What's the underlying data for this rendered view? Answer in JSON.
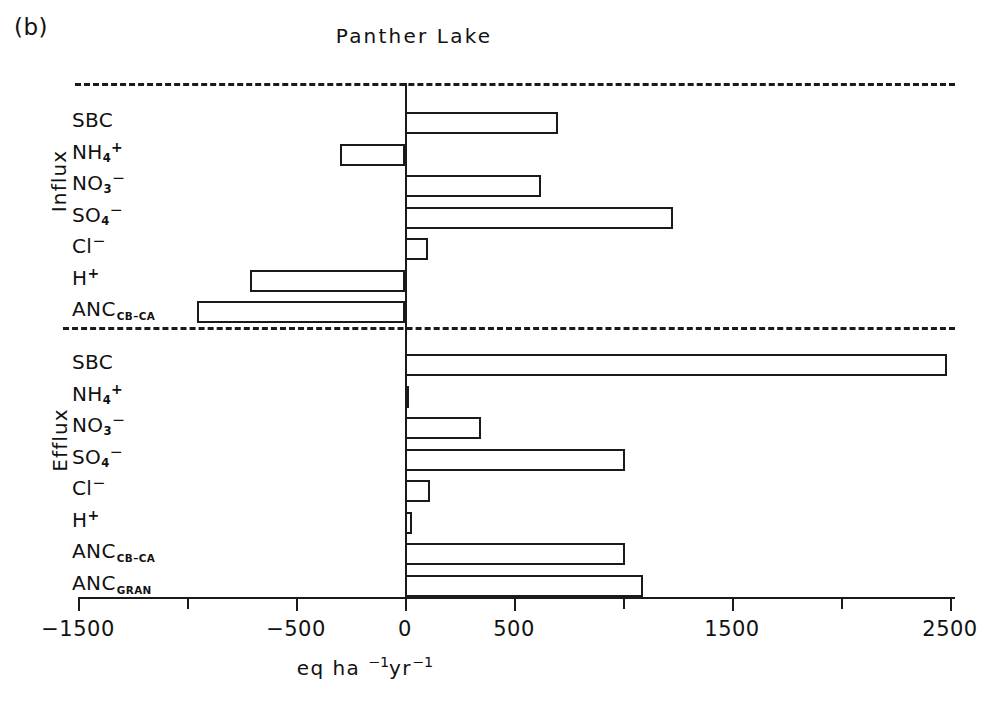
{
  "figure": {
    "panel_letter": "(b)",
    "title": "Panther Lake",
    "xlabel_parts": {
      "main": "eq ha",
      "sup1": "−1",
      "mid": "yr",
      "sup2": "−1"
    }
  },
  "axis": {
    "xlim": [
      -1500,
      2500
    ],
    "major_ticks": [
      -1500,
      -500,
      0,
      500,
      1500,
      2500
    ],
    "minor_ticks": [
      -1000,
      1000,
      2000
    ],
    "tick_labels": [
      "−1500",
      "−500",
      "0",
      "500",
      "1500",
      "2500"
    ],
    "unit_label": "eq ha −1 yr −1"
  },
  "groups": [
    {
      "name": "Influx",
      "caption": "Influx"
    },
    {
      "name": "Efflux",
      "caption": "Efflux"
    }
  ],
  "chart_data": {
    "type": "bar",
    "orientation": "horizontal",
    "title": "Panther Lake",
    "xlabel": "eq ha⁻¹yr⁻¹",
    "ylabel": "",
    "xlim": [
      -1500,
      2500
    ],
    "xticks": [
      -1500,
      -1000,
      -500,
      0,
      500,
      1000,
      1500,
      2000,
      2500
    ],
    "xtick_labels": [
      "−1500",
      "",
      "−500",
      "0",
      "500",
      "",
      "1500",
      "",
      "2500"
    ],
    "grid": false,
    "legend": "none",
    "groups": [
      {
        "name": "Influx",
        "categories": [
          "SBC",
          "NH4+",
          "NO3-",
          "SO4-",
          "Cl-",
          "H+",
          "ANC_CB-CA"
        ],
        "values": [
          700,
          -300,
          625,
          1230,
          105,
          -710,
          -955
        ]
      },
      {
        "name": "Efflux",
        "categories": [
          "SBC",
          "NH4+",
          "NO3-",
          "SO4-",
          "Cl-",
          "H+",
          "ANC_CB-CA",
          "ANC_GRAN"
        ],
        "values": [
          2485,
          10,
          350,
          1010,
          115,
          30,
          1010,
          1090
        ]
      }
    ]
  },
  "influx_rows": [
    {
      "label": "SBC",
      "sub": "",
      "sup": "",
      "value": 700
    },
    {
      "label": "NH",
      "sub": "4",
      "sup": "+",
      "value": -300
    },
    {
      "label": "NO",
      "sub": "3",
      "sup": "−",
      "value": 625
    },
    {
      "label": "SO",
      "sub": "4",
      "sup": "−",
      "value": 1230
    },
    {
      "label": "Cl",
      "sub": "",
      "sup": "−",
      "value": 105
    },
    {
      "label": "H",
      "sub": "",
      "sup": "+",
      "value": -710
    },
    {
      "label": "ANC",
      "sub": "CB–CA",
      "sup": "",
      "value": -955
    }
  ],
  "efflux_rows": [
    {
      "label": "SBC",
      "sub": "",
      "sup": "",
      "value": 2485
    },
    {
      "label": "NH",
      "sub": "4",
      "sup": "+",
      "value": 10
    },
    {
      "label": "NO",
      "sub": "3",
      "sup": "−",
      "value": 350
    },
    {
      "label": "SO",
      "sub": "4",
      "sup": "−",
      "value": 1010
    },
    {
      "label": "Cl",
      "sub": "",
      "sup": "−",
      "value": 115
    },
    {
      "label": "H",
      "sub": "",
      "sup": "+",
      "value": 30
    },
    {
      "label": "ANC",
      "sub": "CB–CA",
      "sup": "",
      "value": 1010
    },
    {
      "label": "ANC",
      "sub": "GRAN",
      "sup": "",
      "value": 1090
    }
  ],
  "colors": {
    "ink": "#1a1a1a",
    "bar_fill": "#ffffff",
    "background": "#ffffff"
  }
}
